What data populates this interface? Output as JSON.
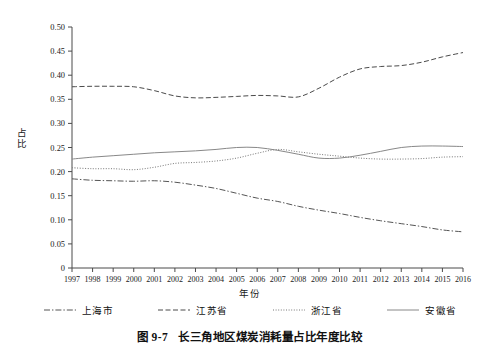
{
  "chart_data": {
    "type": "line",
    "title": "",
    "caption_number": "图 9-7",
    "caption_text": "长三角地区煤炭消耗量占比年度比较",
    "xlabel": "年份",
    "ylabel": "占比",
    "categories": [
      "1997",
      "1998",
      "1999",
      "2000",
      "2001",
      "2002",
      "2003",
      "2004",
      "2005",
      "2006",
      "2007",
      "2008",
      "2009",
      "2010",
      "2011",
      "2012",
      "2013",
      "2014",
      "2015",
      "2016"
    ],
    "x": [
      1997,
      1998,
      1999,
      2000,
      2001,
      2002,
      2003,
      2004,
      2005,
      2006,
      2007,
      2008,
      2009,
      2010,
      2011,
      2012,
      2013,
      2014,
      2015,
      2016
    ],
    "ylim": [
      0,
      0.5
    ],
    "yticks": [
      "0",
      "0.05",
      "0.10",
      "0.15",
      "0.20",
      "0.25",
      "0.30",
      "0.35",
      "0.40",
      "0.45",
      "0.50"
    ],
    "ytick_values": [
      0,
      0.05,
      0.1,
      0.15,
      0.2,
      0.25,
      0.3,
      0.35,
      0.4,
      0.45,
      0.5
    ],
    "grid": false,
    "legend_position": "bottom",
    "series": [
      {
        "name": "上海市",
        "style": "dash-dot",
        "color": "#555555",
        "values": [
          0.185,
          0.182,
          0.181,
          0.18,
          0.181,
          0.178,
          0.172,
          0.165,
          0.155,
          0.145,
          0.138,
          0.128,
          0.12,
          0.113,
          0.105,
          0.098,
          0.092,
          0.086,
          0.079,
          0.075
        ]
      },
      {
        "name": "江苏省",
        "style": "dashed",
        "color": "#4a4a4a",
        "values": [
          0.376,
          0.377,
          0.377,
          0.376,
          0.368,
          0.357,
          0.353,
          0.354,
          0.356,
          0.358,
          0.357,
          0.355,
          0.373,
          0.396,
          0.413,
          0.418,
          0.42,
          0.427,
          0.438,
          0.447
        ]
      },
      {
        "name": "浙江省",
        "style": "dotted",
        "color": "#777777",
        "values": [
          0.208,
          0.206,
          0.206,
          0.204,
          0.209,
          0.217,
          0.219,
          0.222,
          0.228,
          0.238,
          0.246,
          0.241,
          0.236,
          0.232,
          0.228,
          0.226,
          0.226,
          0.227,
          0.23,
          0.231
        ]
      },
      {
        "name": "安徽省",
        "style": "solid",
        "color": "#888888",
        "values": [
          0.226,
          0.23,
          0.233,
          0.236,
          0.239,
          0.241,
          0.243,
          0.246,
          0.25,
          0.25,
          0.244,
          0.236,
          0.228,
          0.228,
          0.234,
          0.242,
          0.25,
          0.253,
          0.253,
          0.252
        ]
      }
    ]
  },
  "axes": {
    "xlabel": "年份",
    "ylabel": "占比",
    "y_ticks": [
      "0.50",
      "0.45",
      "0.40",
      "0.35",
      "0.30",
      "0.25",
      "0.20",
      "0.15",
      "0.10",
      "0.05",
      "0"
    ],
    "x_ticks": [
      "1997",
      "1998",
      "1999",
      "2000",
      "2001",
      "2002",
      "2003",
      "2004",
      "2005",
      "2006",
      "2007",
      "2008",
      "2009",
      "2010",
      "2011",
      "2012",
      "2013",
      "2014",
      "2015",
      "2016"
    ]
  },
  "legend": {
    "items": [
      {
        "label": "上海市",
        "style": "dash-dot"
      },
      {
        "label": "江苏省",
        "style": "dashed"
      },
      {
        "label": "浙江省",
        "style": "dotted"
      },
      {
        "label": "安徽省",
        "style": "solid"
      }
    ]
  },
  "caption": {
    "number": "图 9-7",
    "text": "长三角地区煤炭消耗量占比年度比较"
  }
}
